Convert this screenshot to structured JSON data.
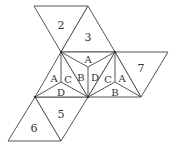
{
  "diagram": {
    "type": "polyhedron-net",
    "stroke_color": "#555555",
    "faces": [
      {
        "label": "2",
        "points": [
          [
            34,
            6
          ],
          [
            88,
            6
          ],
          [
            61,
            52
          ]
        ],
        "label_pos": [
          61,
          26
        ]
      },
      {
        "label": "3",
        "points": [
          [
            88,
            6
          ],
          [
            61,
            52
          ],
          [
            115,
            52
          ]
        ],
        "label_pos": [
          88,
          38
        ]
      },
      {
        "label": "7",
        "points": [
          [
            115,
            52
          ],
          [
            168,
            52
          ],
          [
            141,
            97
          ]
        ],
        "label_pos": [
          141,
          69
        ]
      },
      {
        "label": "5",
        "points": [
          [
            35,
            97
          ],
          [
            88,
            97
          ],
          [
            61,
            141
          ]
        ],
        "label_pos": [
          61,
          115
        ]
      },
      {
        "label": "6",
        "points": [
          [
            35,
            97
          ],
          [
            61,
            141
          ],
          [
            8,
            141
          ]
        ],
        "label_pos": [
          34,
          129
        ]
      }
    ],
    "subdivided": [
      {
        "points": [
          [
            61,
            52
          ],
          [
            35,
            97
          ],
          [
            88,
            97
          ]
        ],
        "center": [
          61,
          82
        ]
      },
      {
        "points": [
          [
            61,
            52
          ],
          [
            115,
            52
          ],
          [
            88,
            97
          ]
        ],
        "center": [
          88,
          67
        ]
      },
      {
        "points": [
          [
            115,
            52
          ],
          [
            88,
            97
          ],
          [
            141,
            97
          ]
        ],
        "center": [
          115,
          82
        ]
      }
    ],
    "letters": [
      {
        "text": "A",
        "pos": [
          88,
          60
        ]
      },
      {
        "text": "A",
        "pos": [
          54,
          79
        ]
      },
      {
        "text": "C",
        "pos": [
          68,
          80
        ]
      },
      {
        "text": "B",
        "pos": [
          81,
          78
        ]
      },
      {
        "text": "D",
        "pos": [
          95,
          78
        ]
      },
      {
        "text": "C",
        "pos": [
          108,
          80
        ]
      },
      {
        "text": "A",
        "pos": [
          122,
          79
        ]
      },
      {
        "text": "D",
        "pos": [
          61,
          93
        ]
      },
      {
        "text": "B",
        "pos": [
          115,
          93
        ]
      }
    ]
  }
}
